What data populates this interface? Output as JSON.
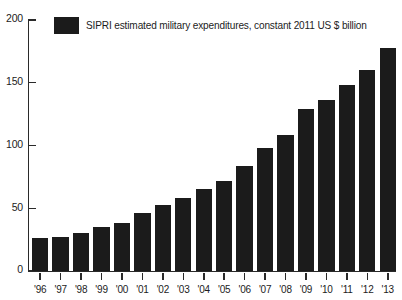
{
  "chart_data": {
    "type": "bar",
    "title": "",
    "subtitle": "",
    "xlabel": "",
    "ylabel": "",
    "ylim": [
      0,
      200
    ],
    "yticks": [
      0,
      50,
      100,
      150,
      200
    ],
    "ytick_labels": [
      "0",
      "50",
      "100",
      "150",
      "200"
    ],
    "grid": false,
    "legend_position": "top-left",
    "legend": [
      {
        "label": "SIPRI estimated military expenditures, constant 2011 US $ billion",
        "color": "#1b1b1b"
      }
    ],
    "categories": [
      "'96",
      "'97",
      "'98",
      "'99",
      "'00",
      "'01",
      "'02",
      "'03",
      "'04",
      "'05",
      "'06",
      "'07",
      "'08",
      "'09",
      "'10",
      "'11",
      "'12",
      "'13"
    ],
    "series": [
      {
        "name": "SIPRI estimated military expenditures, constant 2011 US $ billion",
        "color": "#1b1b1b",
        "values": [
          26,
          27,
          30,
          35,
          38,
          46,
          53,
          58,
          65,
          72,
          84,
          98,
          108,
          129,
          136,
          148,
          160,
          178
        ]
      }
    ],
    "bar_color": "#1b1b1b",
    "axis_color": "#2a2a2a",
    "background_color": "#ffffff"
  },
  "legend": {
    "swatch_name": "legend-color-swatch",
    "label": "SIPRI estimated military expenditures, constant 2011 US $ billion"
  }
}
